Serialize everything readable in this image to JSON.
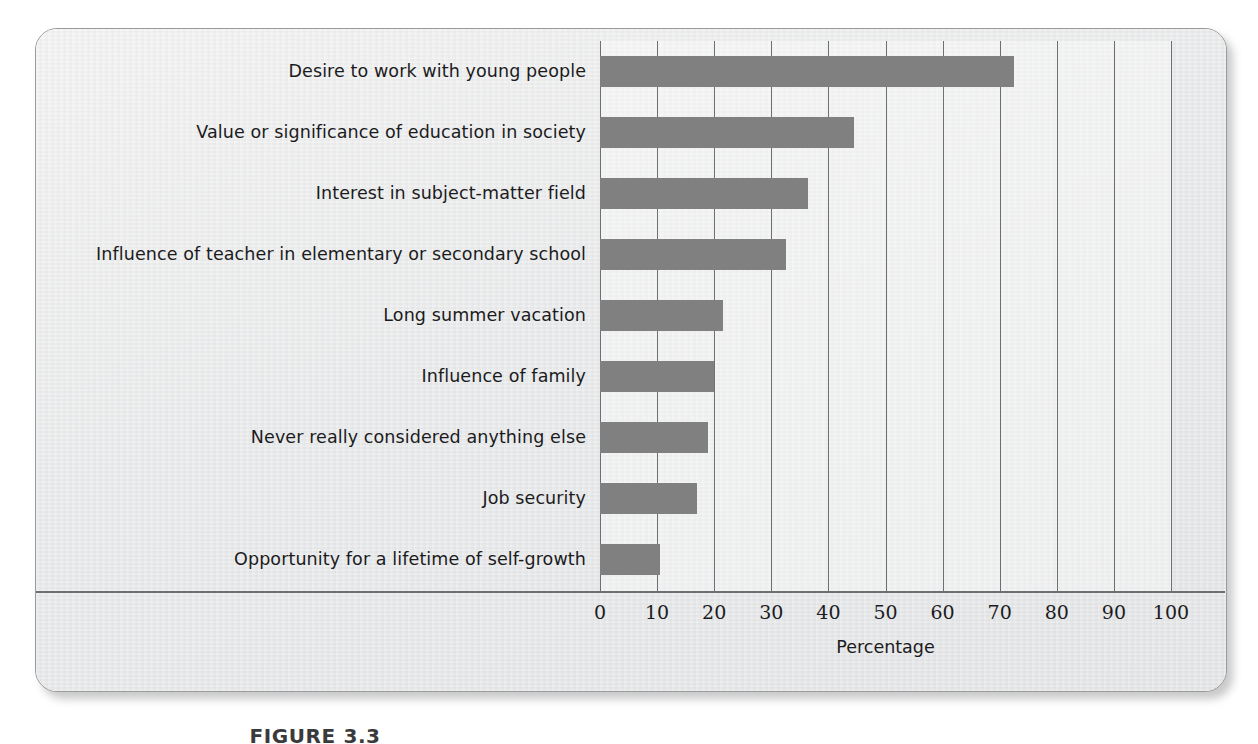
{
  "figure": {
    "caption": "FIGURE 3.3",
    "background_color": "#eceded",
    "bar_color": "#808080",
    "grid_color": "#6e6f71"
  },
  "chart_data": {
    "type": "bar",
    "orientation": "horizontal",
    "title": "",
    "xlabel": "Percentage",
    "ylabel": "",
    "xlim": [
      0,
      100
    ],
    "grid": true,
    "legend": false,
    "x_ticks": [
      0,
      10,
      20,
      30,
      40,
      50,
      60,
      70,
      80,
      90,
      100
    ],
    "x_tick_labels": [
      "0",
      "10",
      "20",
      "30",
      "40",
      "50",
      "60",
      "70",
      "80",
      "90",
      "100"
    ],
    "categories": [
      "Desire to work with young people",
      "Value or significance of education in society",
      "Interest in subject-matter field",
      "Influence of teacher in elementary or secondary school",
      "Long summer vacation",
      "Influence of family",
      "Never really considered anything else",
      "Job security",
      "Opportunity for a lifetime of self-growth"
    ],
    "values": [
      72.5,
      44.5,
      36.5,
      32.5,
      21.5,
      20,
      19,
      17,
      10.5
    ]
  }
}
